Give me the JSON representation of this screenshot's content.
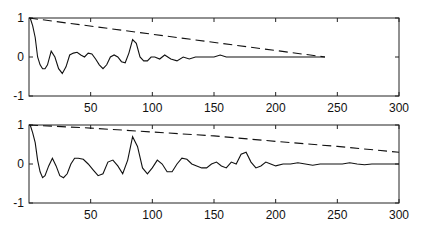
{
  "chart_data": [
    {
      "type": "line",
      "title": "",
      "xlabel": "",
      "ylabel": "",
      "xlim": [
        0,
        300
      ],
      "ylim": [
        -1,
        1
      ],
      "xticks": [
        50,
        100,
        150,
        200,
        250,
        300
      ],
      "yticks": [
        -1,
        0,
        1
      ],
      "grid": false,
      "legend": null,
      "series": [
        {
          "name": "autocorrelation",
          "style": "solid",
          "x": [
            1,
            3,
            5,
            7,
            9,
            11,
            13,
            15,
            18,
            21,
            24,
            27,
            30,
            33,
            36,
            39,
            42,
            45,
            48,
            51,
            54,
            57,
            60,
            63,
            66,
            69,
            72,
            75,
            78,
            81,
            84,
            87,
            90,
            93,
            96,
            99,
            102,
            106,
            110,
            115,
            120,
            125,
            130,
            135,
            140,
            145,
            150,
            155,
            160,
            170,
            180,
            240
          ],
          "y": [
            1.0,
            0.8,
            0.5,
            0.0,
            -0.2,
            -0.3,
            -0.3,
            -0.2,
            0.15,
            0.0,
            -0.3,
            -0.42,
            -0.25,
            0.05,
            0.1,
            0.12,
            0.05,
            0.0,
            0.1,
            0.08,
            -0.05,
            -0.2,
            -0.3,
            -0.2,
            0.0,
            0.05,
            0.0,
            -0.12,
            -0.15,
            0.1,
            0.45,
            0.35,
            0.0,
            -0.1,
            -0.1,
            0.0,
            0.0,
            -0.05,
            0.05,
            -0.05,
            -0.1,
            0.0,
            -0.05,
            0.0,
            0.0,
            0.0,
            0.0,
            0.05,
            0.0,
            0.0,
            0.0,
            0.0
          ]
        },
        {
          "name": "envelope",
          "style": "dashed",
          "x": [
            0,
            240
          ],
          "y": [
            1.0,
            0.0
          ]
        }
      ]
    },
    {
      "type": "line",
      "title": "",
      "xlabel": "",
      "ylabel": "",
      "xlim": [
        0,
        300
      ],
      "ylim": [
        -1,
        1
      ],
      "xticks": [
        50,
        100,
        150,
        200,
        250,
        300
      ],
      "yticks": [
        -1,
        0,
        1
      ],
      "grid": false,
      "legend": null,
      "series": [
        {
          "name": "autocorrelation",
          "style": "solid",
          "x": [
            1,
            3,
            5,
            7,
            9,
            11,
            13,
            16,
            19,
            22,
            25,
            28,
            31,
            34,
            37,
            40,
            44,
            48,
            52,
            56,
            60,
            64,
            68,
            72,
            76,
            80,
            84,
            88,
            92,
            96,
            100,
            104,
            108,
            112,
            116,
            120,
            124,
            128,
            132,
            136,
            140,
            144,
            148,
            152,
            156,
            160,
            164,
            168,
            172,
            176,
            180,
            184,
            188,
            192,
            196,
            200,
            206,
            212,
            218,
            224,
            230,
            236,
            242,
            248,
            254,
            260,
            266,
            272,
            278,
            284,
            290,
            296,
            300
          ],
          "y": [
            1.0,
            0.8,
            0.55,
            0.1,
            -0.2,
            -0.35,
            -0.3,
            -0.05,
            0.15,
            -0.05,
            -0.3,
            -0.35,
            -0.25,
            0.0,
            0.15,
            0.15,
            0.12,
            0.0,
            -0.15,
            -0.3,
            -0.25,
            0.05,
            0.1,
            -0.05,
            -0.25,
            0.1,
            0.7,
            0.45,
            -0.1,
            -0.25,
            -0.1,
            0.1,
            0.0,
            -0.2,
            -0.2,
            0.0,
            0.15,
            0.12,
            0.0,
            -0.05,
            -0.1,
            -0.1,
            0.0,
            0.05,
            -0.05,
            -0.1,
            0.05,
            0.0,
            0.25,
            0.3,
            0.05,
            -0.1,
            -0.05,
            0.05,
            0.0,
            -0.05,
            0.0,
            0.0,
            0.03,
            0.0,
            -0.03,
            0.0,
            0.0,
            0.0,
            0.0,
            0.03,
            0.0,
            -0.02,
            0.0,
            0.0,
            0.0,
            0.0,
            0.0
          ]
        },
        {
          "name": "envelope",
          "style": "dashed",
          "x": [
            0,
            50,
            100,
            150,
            200,
            250,
            300
          ],
          "y": [
            1.0,
            0.92,
            0.82,
            0.72,
            0.58,
            0.45,
            0.3
          ]
        }
      ]
    }
  ],
  "labels": {
    "top": {
      "yticks": [
        "1",
        "0",
        "-1"
      ],
      "xticks": [
        "50",
        "100",
        "150",
        "200",
        "250",
        "300"
      ]
    },
    "bottom": {
      "yticks": [
        "1",
        "0",
        "-1"
      ],
      "xticks": [
        "50",
        "100",
        "150",
        "200",
        "250",
        "300"
      ]
    }
  }
}
